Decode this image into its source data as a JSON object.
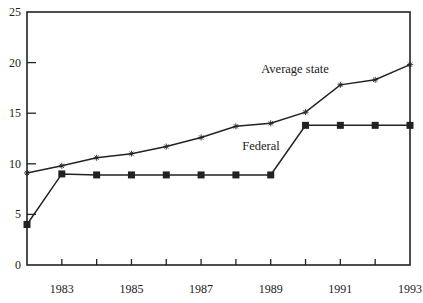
{
  "chart_data": {
    "type": "line",
    "title": "",
    "xlabel": "",
    "ylabel": "",
    "x": [
      1982,
      1983,
      1984,
      1985,
      1986,
      1987,
      1988,
      1989,
      1990,
      1991,
      1992,
      1993
    ],
    "xlim": [
      1982,
      1993
    ],
    "ylim": [
      0,
      25
    ],
    "xticks": [
      1982,
      1983,
      1984,
      1985,
      1986,
      1987,
      1988,
      1989,
      1990,
      1991,
      1992,
      1993
    ],
    "xtick_labels": [
      {
        "value": 1983,
        "label": "1983"
      },
      {
        "value": 1985,
        "label": "1985"
      },
      {
        "value": 1987,
        "label": "1987"
      },
      {
        "value": 1989,
        "label": "1989"
      },
      {
        "value": 1991,
        "label": "1991"
      },
      {
        "value": 1993,
        "label": "1993"
      }
    ],
    "yticks": [
      0,
      5,
      10,
      15,
      20,
      25
    ],
    "ytick_labels": [
      "0",
      "5",
      "10",
      "15",
      "20",
      "25"
    ],
    "grid": false,
    "legend": "none (inline annotations)",
    "series": [
      {
        "name": "Average state",
        "marker": "asterisk",
        "values": [
          9.1,
          9.8,
          10.6,
          11.0,
          11.7,
          12.6,
          13.7,
          14.0,
          15.1,
          17.8,
          18.3,
          19.8
        ]
      },
      {
        "name": "Federal",
        "marker": "square",
        "values": [
          4.0,
          9.0,
          8.9,
          8.9,
          8.9,
          8.9,
          8.9,
          8.9,
          13.8,
          13.8,
          13.8,
          13.8
        ]
      }
    ],
    "annotations": [
      {
        "text": "Average state",
        "series": "Average state",
        "near_x": 1990
      },
      {
        "text": "Federal",
        "series": "Federal",
        "near_x": 1988
      }
    ],
    "colors": {
      "line": "#222222",
      "axis": "#222222",
      "background": "#ffffff"
    }
  }
}
